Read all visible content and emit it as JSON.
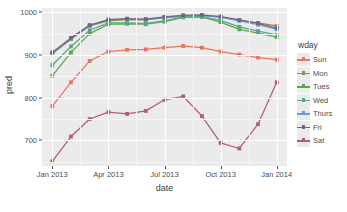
{
  "chart_data": {
    "type": "line",
    "title": "",
    "xlabel": "date",
    "ylabel": "pred",
    "grid": true,
    "legend_position": "right",
    "legend_title": "wday",
    "xlim": [
      "2012-12-15",
      "2014-01-15"
    ],
    "ylim": [
      640,
      1010
    ],
    "y_ticks": [
      700,
      800,
      900,
      1000
    ],
    "y_tick_labels": [
      "700",
      "800",
      "900",
      "1000"
    ],
    "x_ticks": [
      "Jan 2013",
      "Apr 2013",
      "Jul 2013",
      "Oct 2013",
      "Jan 2014"
    ],
    "x_values": [
      "2013-01-01",
      "2013-02-01",
      "2013-03-01",
      "2013-04-01",
      "2013-05-01",
      "2013-06-01",
      "2013-07-01",
      "2013-08-01",
      "2013-09-01",
      "2013-10-01",
      "2013-11-01",
      "2013-12-01",
      "2014-01-01"
    ],
    "series": [
      {
        "name": "Sun",
        "color": "#F8766D",
        "values": [
          780,
          836,
          886,
          908,
          912,
          913,
          917,
          921,
          917,
          908,
          901,
          894,
          889
        ]
      },
      {
        "name": "Mon",
        "color": "#C49A00",
        "values": [
          903,
          937,
          968,
          980,
          983,
          982,
          987,
          991,
          992,
          989,
          981,
          975,
          968
        ]
      },
      {
        "name": "Tues",
        "color": "#53B400",
        "values": [
          851,
          906,
          950,
          972,
          973,
          972,
          978,
          988,
          989,
          977,
          960,
          951,
          942
        ]
      },
      {
        "name": "Wed",
        "color": "#00C094",
        "values": [
          876,
          920,
          958,
          975,
          975,
          974,
          980,
          989,
          990,
          981,
          966,
          956,
          947
        ]
      },
      {
        "name": "Thurs",
        "color": "#00B6EB",
        "values": [
          905,
          939,
          969,
          982,
          984,
          983,
          988,
          992,
          993,
          988,
          980,
          971,
          960
        ]
      },
      {
        "name": "Fri",
        "color": "#A58AFF",
        "values": [
          906,
          940,
          970,
          983,
          985,
          984,
          989,
          993,
          994,
          990,
          982,
          974,
          963
        ]
      },
      {
        "name": "Sat",
        "color": "#FB61D7",
        "values": [
          651,
          709,
          750,
          766,
          762,
          769,
          795,
          803,
          757,
          694,
          681,
          738,
          836
        ]
      }
    ]
  },
  "axes": {
    "y_title": "pred",
    "x_title": "date"
  },
  "legend": {
    "title": "wday",
    "items": [
      {
        "label": "Sun",
        "color": "#F8766D"
      },
      {
        "label": "Mon",
        "color": "#B79F00"
      },
      {
        "label": "Tues",
        "color": "#4DAF4A"
      },
      {
        "label": "Wed",
        "color": "#00BFA0"
      },
      {
        "label": "Thurs",
        "color": "#5C9EDC"
      },
      {
        "label": "Fri",
        "color": "#7F6FA8"
      },
      {
        "label": "Sat",
        "color": "#C9577E"
      }
    ]
  },
  "render_colors": {
    "Sun": "#E8735F",
    "Mon": "#9B8A4E",
    "Tues": "#5FA545",
    "Wed": "#4FA98C",
    "Thurs": "#6B9FD4",
    "Fri": "#6E6683",
    "Sat": "#B45C72",
    "panel_bg": "#ebebeb",
    "grid_major": "#ffffff",
    "grid_minor": "#f5f5f5",
    "text": "#4d4d4d"
  }
}
